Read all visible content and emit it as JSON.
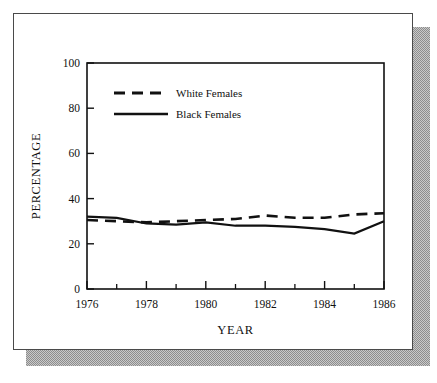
{
  "figure": {
    "background_color": "#ffffff",
    "frame_color": "#4a4a4a",
    "shadow_color": "#9a9a9a"
  },
  "chart_data": {
    "type": "line",
    "title": "",
    "xlabel": "YEAR",
    "ylabel": "PERCENTAGE",
    "xlim": [
      1976,
      1986
    ],
    "ylim": [
      0,
      100
    ],
    "grid": false,
    "legend_position": "top-left-inside",
    "x": [
      1976,
      1977,
      1978,
      1979,
      1980,
      1981,
      1982,
      1983,
      1984,
      1985,
      1986
    ],
    "xticks": [
      1976,
      1978,
      1980,
      1982,
      1984,
      1986
    ],
    "xtick_labels": [
      "1976",
      "1978",
      "1980",
      "1982",
      "1984",
      "1986"
    ],
    "xminor_ticks": [
      1977,
      1979,
      1981,
      1983,
      1985
    ],
    "yticks": [
      0,
      20,
      40,
      60,
      80,
      100
    ],
    "ytick_labels": [
      "0",
      "20",
      "40",
      "60",
      "80",
      "100"
    ],
    "series": [
      {
        "name": "White Females",
        "style": "dashed",
        "color": "#111111",
        "values": [
          30.5,
          30.0,
          29.5,
          30.0,
          30.5,
          31.0,
          32.5,
          31.5,
          31.5,
          33.0,
          33.5
        ]
      },
      {
        "name": "Black Females",
        "style": "solid",
        "color": "#111111",
        "values": [
          32.0,
          31.5,
          29.0,
          28.5,
          29.5,
          28.0,
          28.0,
          27.5,
          26.5,
          24.5,
          30.0
        ]
      }
    ]
  },
  "legend": {
    "entries": [
      {
        "label": "White Females",
        "style": "dashed"
      },
      {
        "label": "Black Females",
        "style": "solid"
      }
    ]
  }
}
